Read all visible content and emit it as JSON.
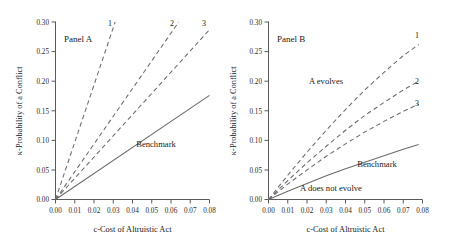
{
  "figure": {
    "panels": [
      {
        "id": "panel-a",
        "label": "Panel A",
        "xlabel": "c-Cost of Altruistic Act",
        "ylabel": "κ-Probability of a Conflict",
        "xticks": [
          "0.00",
          "0.01",
          "0.02",
          "0.03",
          "0.04",
          "0.05",
          "0.06",
          "0.07",
          "0.08"
        ],
        "yticks": [
          "0.00",
          "0.05",
          "0.10",
          "0.15",
          "0.20",
          "0.25",
          "0.30"
        ],
        "annotations": [
          {
            "name": "benchmark-label",
            "text": "Benchmark"
          },
          {
            "name": "curve-label-1",
            "text": "1"
          },
          {
            "name": "curve-label-2",
            "text": "2"
          },
          {
            "name": "curve-label-3",
            "text": "3"
          }
        ]
      },
      {
        "id": "panel-b",
        "label": "Panel B",
        "xlabel": "c-Cost of Altruistic Act",
        "ylabel": "κ-Probability of a Conflict",
        "xticks": [
          "0.00",
          "0.01",
          "0.02",
          "0.03",
          "0.04",
          "0.05",
          "0.06",
          "0.07",
          "0.08"
        ],
        "yticks": [
          "0.00",
          "0.05",
          "0.10",
          "0.15",
          "0.20",
          "0.25",
          "0.30"
        ],
        "annotations": [
          {
            "name": "a-evolves-label",
            "text": "A evolves"
          },
          {
            "name": "a-does-not-evolve-label",
            "text": "A does not evolve"
          },
          {
            "name": "benchmark-label",
            "text": "Benchmark"
          },
          {
            "name": "curve-label-1",
            "text": "1"
          },
          {
            "name": "curve-label-2",
            "text": "2"
          },
          {
            "name": "curve-label-3",
            "text": "3"
          }
        ]
      }
    ]
  },
  "chart_data": [
    {
      "type": "line",
      "title": "Panel A",
      "xlabel": "c-Cost of Altruistic Act",
      "ylabel": "κ-Probability of a Conflict",
      "xlim": [
        0.0,
        0.08
      ],
      "ylim": [
        0.0,
        0.3
      ],
      "grid": false,
      "legend": "inline-labels",
      "series": [
        {
          "name": "1",
          "style": "dashed",
          "x": [
            0.0,
            0.031
          ],
          "y": [
            0.0,
            0.3
          ]
        },
        {
          "name": "2",
          "style": "dashed",
          "x": [
            0.0,
            0.064
          ],
          "y": [
            0.0,
            0.3
          ]
        },
        {
          "name": "3",
          "style": "dashed",
          "x": [
            0.0,
            0.08
          ],
          "y": [
            0.0,
            0.287
          ]
        },
        {
          "name": "Benchmark",
          "style": "solid",
          "x": [
            0.0,
            0.08
          ],
          "y": [
            0.0,
            0.176
          ]
        }
      ]
    },
    {
      "type": "line",
      "title": "Panel B",
      "xlabel": "c-Cost of Altruistic Act",
      "ylabel": "κ-Probability of a Conflict",
      "xlim": [
        0.0,
        0.08
      ],
      "ylim": [
        0.0,
        0.3
      ],
      "grid": false,
      "legend": "inline-labels",
      "series": [
        {
          "name": "1",
          "style": "dashed",
          "x": [
            0.0,
            0.01,
            0.02,
            0.03,
            0.04,
            0.05,
            0.06,
            0.07,
            0.078
          ],
          "y": [
            0.0,
            0.041,
            0.08,
            0.117,
            0.152,
            0.185,
            0.215,
            0.243,
            0.262
          ]
        },
        {
          "name": "2",
          "style": "dashed",
          "x": [
            0.0,
            0.01,
            0.02,
            0.03,
            0.04,
            0.05,
            0.06,
            0.07,
            0.078
          ],
          "y": [
            0.0,
            0.032,
            0.062,
            0.09,
            0.117,
            0.142,
            0.164,
            0.185,
            0.2
          ]
        },
        {
          "name": "3",
          "style": "dashed",
          "x": [
            0.0,
            0.01,
            0.02,
            0.03,
            0.04,
            0.05,
            0.06,
            0.07,
            0.078
          ],
          "y": [
            0.0,
            0.026,
            0.05,
            0.073,
            0.094,
            0.114,
            0.132,
            0.149,
            0.161
          ]
        },
        {
          "name": "Benchmark",
          "style": "solid",
          "x": [
            0.0,
            0.01,
            0.02,
            0.03,
            0.04,
            0.05,
            0.06,
            0.07,
            0.078
          ],
          "y": [
            0.0,
            0.014,
            0.027,
            0.04,
            0.052,
            0.063,
            0.074,
            0.085,
            0.093
          ]
        }
      ]
    }
  ]
}
